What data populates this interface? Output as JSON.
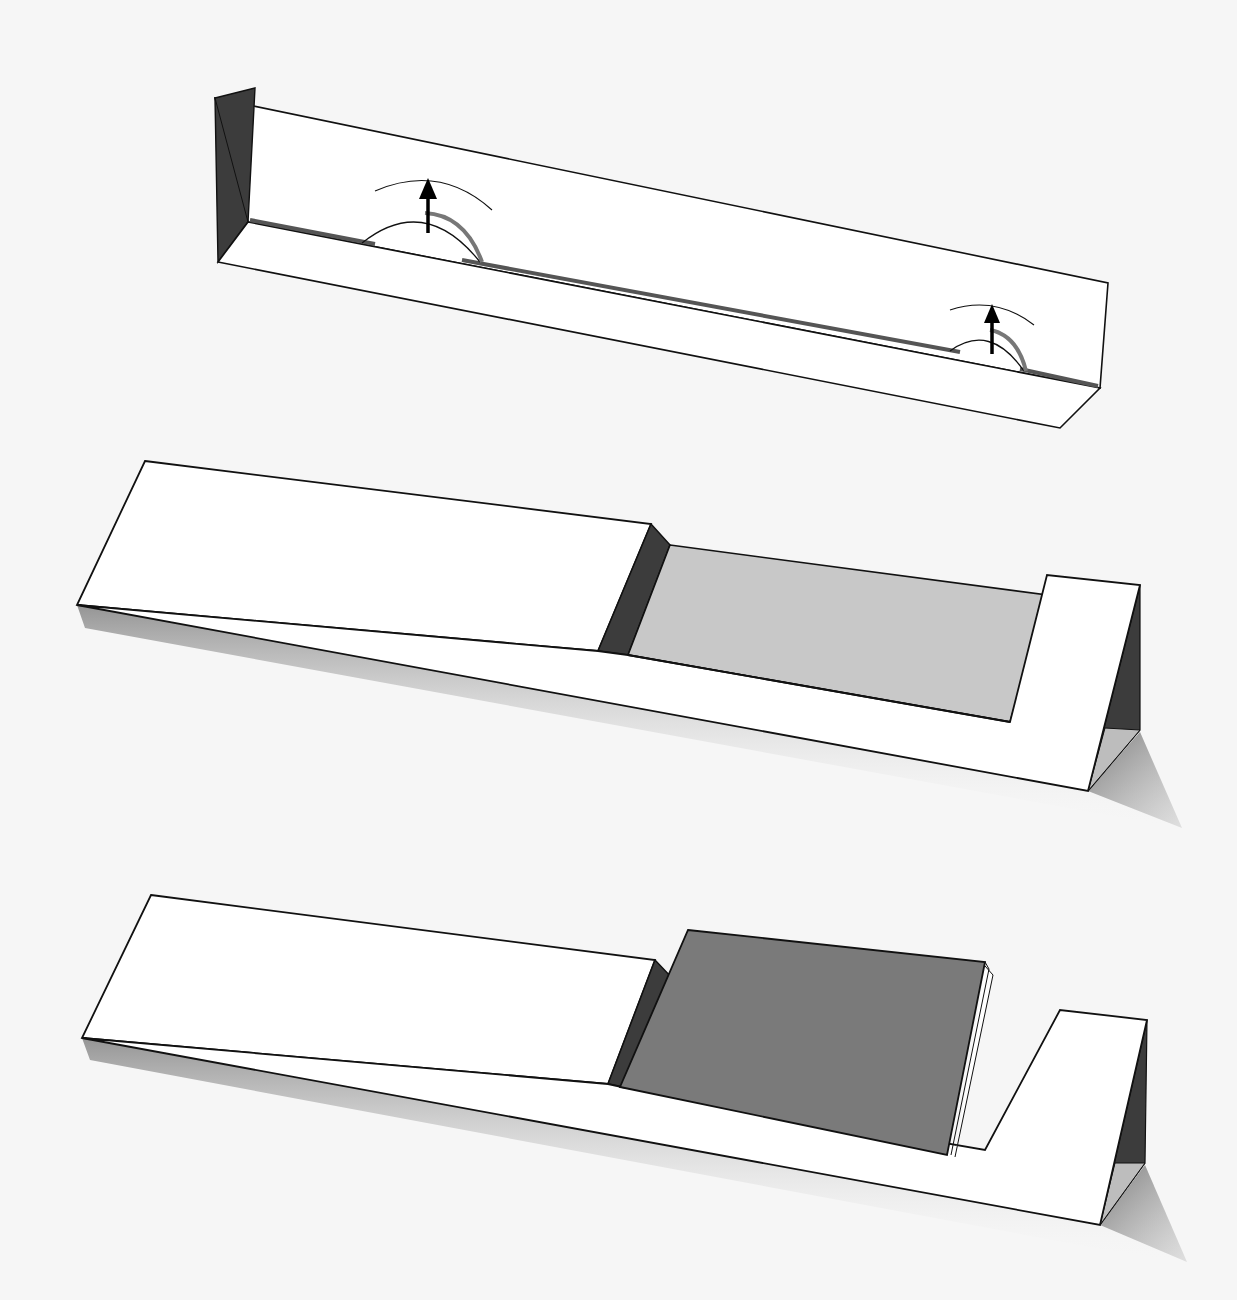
{
  "diagram": {
    "title": "",
    "background": "#f6f6f6",
    "colors": {
      "paper": "#ffffff",
      "outline": "#111111",
      "dark_fold": "#3c3c3c",
      "light_gray_face": "#c8c8c8",
      "card_gray": "#7a7a7a",
      "shadow": "#9a9a9a",
      "slot": "#555555",
      "arrow": "#000000"
    },
    "steps": [
      {
        "id": "step-1",
        "description": "Folded strip with two tabs cut and lifted upward",
        "back_panel": "215,98 1108,283 1100,388 248,222",
        "left_side_dark": "215,98 255,85 248,222 218,262",
        "base_panel": "218,262 248,222 1100,388 1060,428",
        "slots": [
          {
            "points": "250,220 375,244",
            "arc": "M 362 243 Q 425 193 480 262"
          },
          {
            "points": "462,260 960,352",
            "arc": "M 950 351 Q 990 322 1022 370"
          },
          {
            "points": "1020,369 1098,386",
            "arc": ""
          }
        ],
        "arrows": [
          {
            "x1": 428,
            "y1": 233,
            "x2": 428,
            "y2": 178,
            "guide": "M 375 191 Q 440 163 490 208"
          },
          {
            "x1": 992,
            "y1": 354,
            "x2": 992,
            "y2": 305,
            "guide": "M 950 310 Q 995 295 1034 325"
          }
        ]
      },
      {
        "id": "step-2",
        "description": "Stand folded into triangle with recessed opening",
        "top_left_panel": "145,461 651,524 598,651 77,605",
        "inner_dark_left": "651,524 670,545 628,655 598,651",
        "inner_gray_face": "670,545 1047,595 1010,722 628,655",
        "front_face": "77,605 598,651 1010,722 1047,575 1140,585 1088,791",
        "right_tab": "1047,575 1140,585 1088,791 1010,722",
        "right_dark_side": "1140,585 1140,732 1088,791",
        "right_gray_bottom": "1140,732 1088,791 1105,730",
        "shadow": "77,605 1088,791 1140,732 1180,825 1100,815 90,620"
      },
      {
        "id": "step-3",
        "description": "Stand with stack of cards inserted into the opening",
        "top_left_panel": "151,895 655,960 608,1084 82,1038",
        "inner_dark_left": "655,960 672,978 622,1087 608,1084",
        "cards": "688,930 985,962 985,1046 947,1157 620,1087",
        "card_stack_edges": [
          "985,962 990,970 952,1160",
          "988,966 993,975 956,1162"
        ],
        "front_face": "82,1038 608,1084 1032,1155 1060,1010 1147,1020 1100,1225",
        "right_dark_side": "1147,1020 1145,1165 1100,1225",
        "right_gray_bottom": "1145,1165 1100,1225 1115,1165",
        "shadow": "82,1038 1100,1225 1145,1165 1185,1260 1100,1250 95,1052"
      }
    ]
  }
}
